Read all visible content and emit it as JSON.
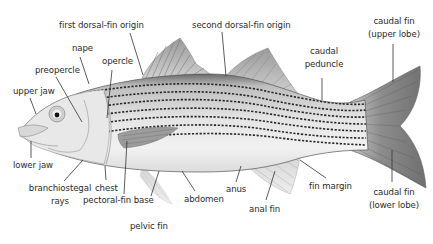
{
  "diagram": {
    "colors": {
      "background": "#ffffff",
      "label_text": "#2b2b2b",
      "leader_line": "#333333",
      "stripe": "#2a2a2a",
      "fin": "#8a8a8a"
    },
    "labels": {
      "first_dorsal_fin_origin": "first dorsal-fin origin",
      "second_dorsal_fin_origin": "second dorsal-fin origin",
      "nape": "nape",
      "opercle": "opercle",
      "preopercle": "preopercle",
      "upper_jaw": "upper jaw",
      "lower_jaw": "lower jaw",
      "caudal_peduncle_1": "caudal",
      "caudal_peduncle_2": "peduncle",
      "caudal_fin_upper_1": "caudal fin",
      "caudal_fin_upper_2": "(upper lobe)",
      "caudal_fin_lower_1": "caudal fin",
      "caudal_fin_lower_2": "(lower lobe)",
      "branchiostegal_rays_1": "branchiostegal",
      "branchiostegal_rays_2": "rays",
      "chest": "chest",
      "pectoral_fin_base": "pectoral-fin base",
      "pelvic_fin": "pelvic fin",
      "abdomen": "abdomen",
      "anus": "anus",
      "anal_fin": "anal fin",
      "fin_margin": "fin margin"
    }
  }
}
